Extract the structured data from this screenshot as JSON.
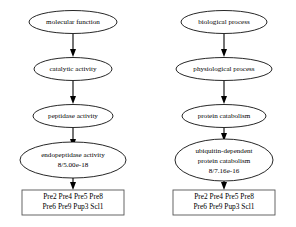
{
  "diagram": {
    "type": "directed-acyclic-graph",
    "background_color": "#ffffff",
    "node_fill": "#ffffff",
    "node_stroke": "#000000",
    "box_stroke": "#555555",
    "edge_color": "#000000",
    "branches": [
      {
        "id": "molecular-function",
        "root_label": "molecular function",
        "nodes": [
          {
            "id": "mf-root",
            "label": "molecular function",
            "shape": "ellipse",
            "lines": [
              "molecular function"
            ]
          },
          {
            "id": "mf-catalytic",
            "label": "catalytic activity",
            "shape": "ellipse",
            "lines": [
              "catalytic activity"
            ]
          },
          {
            "id": "mf-peptidase",
            "label": "peptidase activity",
            "shape": "ellipse",
            "lines": [
              "peptidase activity"
            ]
          },
          {
            "id": "mf-endopeptidase",
            "label": "endopeptidase activity",
            "shape": "ellipse",
            "lines": [
              "endopeptidase activity",
              "8/5.00e-18"
            ],
            "gene_count": "8",
            "p_value": "5.00e-18",
            "stat_text": "8/5.00e-18"
          }
        ],
        "gene_box": {
          "id": "mf-genes",
          "shape": "box",
          "lines": [
            "Pre2 Pre4 Pre5 Pre8",
            "Pre6 Pre9 Pup3 Scl1"
          ],
          "genes": [
            "Pre2",
            "Pre4",
            "Pre5",
            "Pre8",
            "Pre6",
            "Pre9",
            "Pup3",
            "Scl1"
          ]
        },
        "edges": [
          {
            "from": "mf-root",
            "to": "mf-catalytic"
          },
          {
            "from": "mf-catalytic",
            "to": "mf-peptidase"
          },
          {
            "from": "mf-peptidase",
            "to": "mf-endopeptidase"
          },
          {
            "from": "mf-endopeptidase",
            "to": "mf-genes"
          }
        ]
      },
      {
        "id": "biological-process",
        "root_label": "biological process",
        "nodes": [
          {
            "id": "bp-root",
            "label": "biological process",
            "shape": "ellipse",
            "lines": [
              "biological process"
            ]
          },
          {
            "id": "bp-physiological",
            "label": "physiological process",
            "shape": "ellipse",
            "lines": [
              "physiological process"
            ]
          },
          {
            "id": "bp-catabolism",
            "label": "protein catabolism",
            "shape": "ellipse",
            "lines": [
              "protein catabolism"
            ]
          },
          {
            "id": "bp-ubiquitin",
            "label": "ubiquitin-dependent protein catabolism",
            "shape": "ellipse",
            "lines": [
              "ubiquitin-dependent",
              "protein catabolism",
              "8/7.16e-16"
            ],
            "gene_count": "8",
            "p_value": "7.16e-16",
            "stat_text": "8/7.16e-16"
          }
        ],
        "gene_box": {
          "id": "bp-genes",
          "shape": "box",
          "lines": [
            "Pre2 Pre4 Pre5 Pre8",
            "Pre6 Pre9 Pup3 Scl1"
          ],
          "genes": [
            "Pre2",
            "Pre4",
            "Pre5",
            "Pre8",
            "Pre6",
            "Pre9",
            "Pup3",
            "Scl1"
          ]
        },
        "edges": [
          {
            "from": "bp-root",
            "to": "bp-physiological"
          },
          {
            "from": "bp-physiological",
            "to": "bp-catabolism"
          },
          {
            "from": "bp-catabolism",
            "to": "bp-ubiquitin"
          },
          {
            "from": "bp-ubiquitin",
            "to": "bp-genes"
          }
        ]
      }
    ]
  }
}
